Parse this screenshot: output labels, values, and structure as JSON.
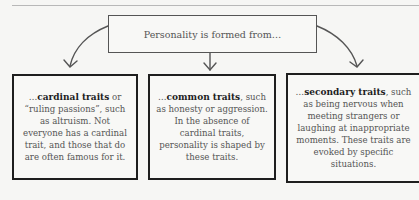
{
  "header": {
    "root_label": "Personality is formed from…"
  },
  "branches": [
    {
      "prefix": "…",
      "term": "cardinal traits",
      "text": " or “ruling passions”, such as altruism. Not everyone has a cardinal trait, and those that do are often famous for it."
    },
    {
      "prefix": "…",
      "term": "common traits",
      "text": ", such as honesty or aggression. In the absence of cardinal traits, personality is shaped by these traits."
    },
    {
      "prefix": "…",
      "term": "secondary traits",
      "text": ", such as being nervous when meeting strangers or laughing at inappropriate moments. These traits are evoked by specific situations."
    }
  ],
  "colors": {
    "background": "#f6f6f4",
    "box_border": "#1e1e1e",
    "text": "#4a4a4a",
    "arrow": "#555555"
  }
}
